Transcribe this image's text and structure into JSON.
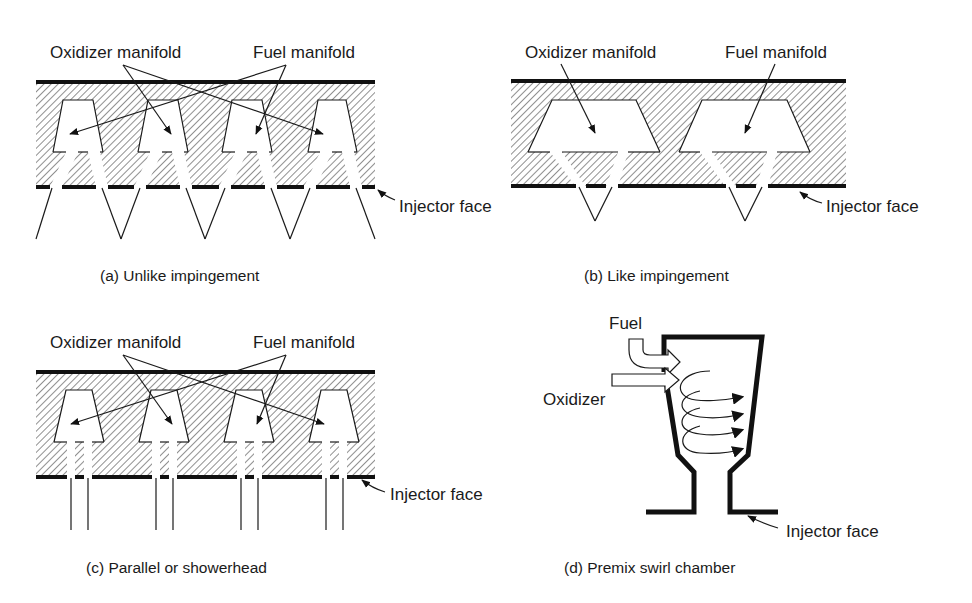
{
  "colors": {
    "ink": "#1a1a1a",
    "background": "#ffffff"
  },
  "panels": {
    "a": {
      "labels": {
        "oxidizer": "Oxidizer manifold",
        "fuel": "Fuel manifold",
        "face": "Injector face"
      },
      "caption": "(a) Unlike impingement"
    },
    "b": {
      "labels": {
        "oxidizer": "Oxidizer manifold",
        "fuel": "Fuel manifold",
        "face": "Injector face"
      },
      "caption": "(b) Like impingement"
    },
    "c": {
      "labels": {
        "oxidizer": "Oxidizer manifold",
        "fuel": "Fuel manifold",
        "face": "Injector face"
      },
      "caption": "(c) Parallel or showerhead"
    },
    "d": {
      "labels": {
        "fuel": "Fuel",
        "oxidizer": "Oxidizer",
        "face": "Injector face"
      },
      "caption": "(d) Premix swirl chamber"
    }
  }
}
